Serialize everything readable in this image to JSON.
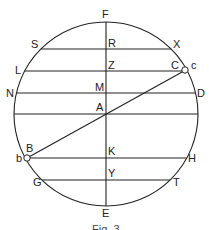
{
  "diagram": {
    "labels": {
      "F": "F",
      "E": "E",
      "S": "S",
      "R": "R",
      "X": "X",
      "L": "L",
      "Z": "Z",
      "C": "C",
      "c": "c",
      "N": "N",
      "M": "M",
      "D": "D",
      "A": "A",
      "B": "B",
      "b": "b",
      "K": "K",
      "H": "H",
      "G": "G",
      "Y": "Y",
      "T": "T"
    },
    "caption": "Fig. 3"
  }
}
